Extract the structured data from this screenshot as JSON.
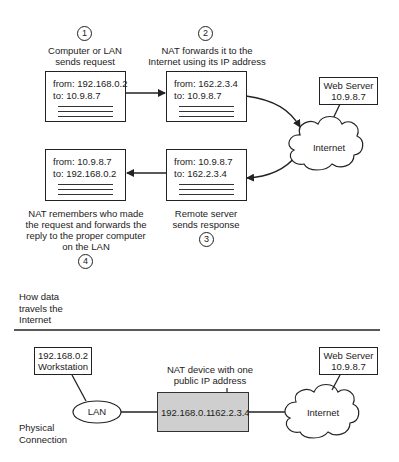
{
  "flow": {
    "steps": [
      {
        "number": "1",
        "caption": "Computer or LAN sends request",
        "caption_lines": [
          "Computer or LAN",
          "sends request"
        ]
      },
      {
        "number": "2",
        "caption": "NAT forwards it to the Internet using its IP address",
        "caption_lines": [
          "NAT forwards it to the",
          "Internet using its IP address"
        ]
      },
      {
        "number": "3",
        "caption": "Remote server sends response",
        "caption_lines": [
          "Remote server",
          "sends response"
        ]
      },
      {
        "number": "4",
        "caption": "NAT remembers who made the request and forwards the reply to the proper computer on the LAN",
        "caption_lines": [
          "NAT remembers who made",
          "the request and forwards the",
          "reply to the proper computer",
          "on the LAN"
        ]
      }
    ],
    "packets": [
      {
        "id": "request-lan",
        "from": "from: 192.168.0.2",
        "to": "to: 10.9.8.7"
      },
      {
        "id": "request-nat",
        "from": "from: 162.2.3.4",
        "to": "to: 10.9.8.7"
      },
      {
        "id": "response-remote",
        "from": "from: 10.9.8.7",
        "to": "to: 162.2.3.4"
      },
      {
        "id": "response-lan",
        "from": "from: 10.9.8.7",
        "to": "to: 192.168.0.2"
      }
    ],
    "web_server": {
      "name": "Web Server",
      "ip": "10.9.8.7"
    },
    "cloud_label": "Internet",
    "section_label_lines": [
      "How data",
      "travels the",
      "Internet"
    ]
  },
  "physical": {
    "workstation": {
      "ip": "192.168.0.2",
      "name": "Workstation"
    },
    "lan_label": "LAN",
    "nat_caption_lines": [
      "NAT device with one",
      "public IP address"
    ],
    "nat_private_ip": "192.168.0.1",
    "nat_public_ip": "162.2.3.4",
    "cloud_label": "Internet",
    "web_server": {
      "name": "Web Server",
      "ip": "10.9.8.7"
    },
    "section_label_lines": [
      "Physical",
      "Connection"
    ]
  },
  "colors": {
    "stroke": "#222222",
    "nat_fill": "#cfcfcf",
    "background": "#ffffff"
  }
}
